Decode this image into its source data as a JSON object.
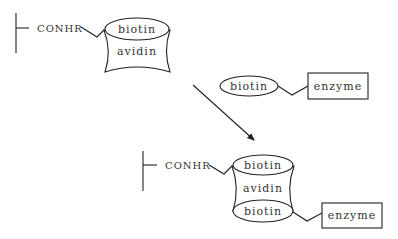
{
  "diagram": {
    "top_complex": {
      "linker_label": "CONHR",
      "avidin_label": "avidin",
      "biotin_label": "biotin"
    },
    "reagent": {
      "biotin_label": "biotin",
      "enzyme_label": "enzyme"
    },
    "arrow": {
      "direction": "down-right"
    },
    "bottom_complex": {
      "linker_label": "CONHR",
      "biotin_top_label": "biotin",
      "avidin_label": "avidin",
      "biotin_bottom_label": "biotin",
      "enzyme_label": "enzyme"
    },
    "colors": {
      "stroke": "#222222",
      "text": "#333333",
      "background": "#ffffff"
    }
  }
}
